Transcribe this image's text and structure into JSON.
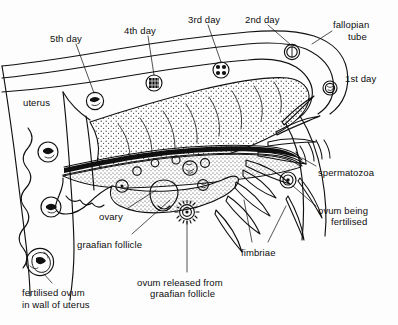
{
  "diagram": {
    "ink_color": "#101010",
    "background_color": "#fdfdfd",
    "stipple_color": "#2a2a2a"
  },
  "labels": [
    {
      "id": "fifth-day",
      "text": "5th day",
      "x": 50,
      "y": 33,
      "align": "left"
    },
    {
      "id": "fourth-day",
      "text": "4th day",
      "x": 124,
      "y": 25,
      "align": "left"
    },
    {
      "id": "third-day",
      "text": "3rd day",
      "x": 188,
      "y": 14,
      "align": "left"
    },
    {
      "id": "second-day",
      "text": "2nd day",
      "x": 245,
      "y": 14,
      "align": "left"
    },
    {
      "id": "fallopian-tube-1",
      "text": "fallopian",
      "x": 333,
      "y": 19,
      "align": "left"
    },
    {
      "id": "fallopian-tube-2",
      "text": "tube",
      "x": 344,
      "y": 31,
      "align": "left"
    },
    {
      "id": "first-day",
      "text": "1st day",
      "x": 345,
      "y": 73,
      "align": "left"
    },
    {
      "id": "uterus",
      "text": "uterus",
      "x": 23,
      "y": 97,
      "align": "left"
    },
    {
      "id": "spermatozoa",
      "text": "spermatozoa",
      "x": 318,
      "y": 167,
      "align": "left"
    },
    {
      "id": "ovum-fert-1",
      "text": "ovum being",
      "x": 318,
      "y": 205,
      "align": "left"
    },
    {
      "id": "ovum-fert-2",
      "text": "fertilised",
      "x": 327,
      "y": 216,
      "align": "left"
    },
    {
      "id": "ovary",
      "text": "ovary",
      "x": 99,
      "y": 211,
      "align": "left"
    },
    {
      "id": "graafian-follicle",
      "text": "graafian follicle",
      "x": 77,
      "y": 239,
      "align": "left"
    },
    {
      "id": "fimbriae",
      "text": "fimbriae",
      "x": 241,
      "y": 247,
      "align": "left"
    },
    {
      "id": "ovum-released-1",
      "text": "ovum  released from",
      "x": 137,
      "y": 277,
      "align": "left"
    },
    {
      "id": "ovum-released-2",
      "text": "graafian follicle",
      "x": 150,
      "y": 288,
      "align": "left"
    },
    {
      "id": "fertilised-ovum-1",
      "text": "fertilised ovum",
      "x": 22,
      "y": 287,
      "align": "left"
    },
    {
      "id": "fertilised-ovum-2",
      "text": "in wall of uterus",
      "x": 22,
      "y": 299,
      "align": "left"
    }
  ],
  "structures": [
    {
      "id": "fallopian-tube",
      "name": "fallopian tube",
      "description": "long curved double-walled duct running from uterus at left to funnel at right"
    },
    {
      "id": "uterus-wall",
      "name": "uterus wall",
      "description": "thick scalloped wall at lower left with implanted embryos"
    },
    {
      "id": "ovary",
      "name": "ovary",
      "description": "stippled oval body below the tube containing follicles"
    },
    {
      "id": "fimbriae",
      "name": "fimbriae",
      "description": "finger-like projections at the funnel end of the tube"
    },
    {
      "id": "broad-ligament",
      "name": "broad ligament",
      "description": "stippled supporting sheet above the ovary"
    }
  ],
  "ova": [
    {
      "id": "ovum-day1",
      "day": "1st day",
      "cx": 330,
      "cy": 88,
      "r": 7.0,
      "stage": "zygote"
    },
    {
      "id": "ovum-day2",
      "day": "2nd day",
      "cx": 292,
      "cy": 52,
      "r": 7.5,
      "stage": "2-cell"
    },
    {
      "id": "ovum-day3",
      "day": "3rd day",
      "cx": 221,
      "cy": 70,
      "r": 8.0,
      "stage": "4-8 cell"
    },
    {
      "id": "ovum-day4",
      "day": "4th day",
      "cx": 154,
      "cy": 83,
      "r": 8.0,
      "stage": "morula"
    },
    {
      "id": "ovum-day5",
      "day": "5th day",
      "cx": 95,
      "cy": 101,
      "r": 8.5,
      "stage": "blastocyst"
    },
    {
      "id": "ovum-wall-1",
      "day": "",
      "cx": 48,
      "cy": 152,
      "r": 10.0,
      "stage": "blastocyst in uterus"
    },
    {
      "id": "ovum-wall-2",
      "day": "",
      "cx": 51,
      "cy": 207,
      "r": 10.0,
      "stage": "implanting"
    },
    {
      "id": "ovum-wall-3",
      "day": "",
      "cx": 40,
      "cy": 262,
      "r": 13.5,
      "stage": "fertilised ovum in wall of uterus"
    },
    {
      "id": "ovum-released",
      "day": "",
      "cx": 187,
      "cy": 212,
      "r": 7.5,
      "stage": "released from graafian follicle"
    },
    {
      "id": "ovum-fertilised",
      "day": "",
      "cx": 288,
      "cy": 180,
      "r": 8.0,
      "stage": "being fertilised"
    }
  ],
  "follicles": [
    {
      "id": "follicle-a",
      "cx": 137,
      "cy": 180,
      "r": 4.0
    },
    {
      "id": "follicle-b",
      "cx": 152,
      "cy": 170,
      "r": 4.5
    },
    {
      "id": "follicle-c",
      "cx": 170,
      "cy": 165,
      "r": 4.0
    },
    {
      "id": "follicle-d",
      "cx": 183,
      "cy": 171,
      "r": 7.0
    },
    {
      "id": "follicle-e",
      "cx": 203,
      "cy": 168,
      "r": 5.0
    },
    {
      "id": "follicle-f",
      "cx": 135,
      "cy": 182,
      "r": 0.0
    },
    {
      "id": "graafian-mature",
      "cx": 132,
      "cy": 184,
      "r": 6.5
    },
    {
      "id": "follicle-corpus",
      "cx": 196,
      "cy": 186,
      "r": 5.5
    }
  ]
}
